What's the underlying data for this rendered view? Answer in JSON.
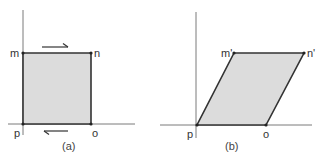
{
  "colors": {
    "fill": "#dcdcdc",
    "outline": "#333333",
    "axis": "#7a7a7a",
    "text": "#333333"
  },
  "panels": [
    {
      "caption": "(a)",
      "shape": "square",
      "points": {
        "m": {
          "label": "m",
          "x": 23,
          "y": 53
        },
        "n": {
          "label": "n",
          "x": 91,
          "y": 53
        },
        "o": {
          "label": "o",
          "x": 91,
          "y": 124
        },
        "p": {
          "label": "p",
          "x": 23,
          "y": 124
        }
      },
      "arrows": [
        {
          "position": "above-top-edge",
          "direction": "right"
        },
        {
          "position": "below-bottom-edge",
          "direction": "left"
        }
      ]
    },
    {
      "caption": "(b)",
      "shape": "parallelogram",
      "points": {
        "m": {
          "label": "m'",
          "x": 234,
          "y": 53
        },
        "n": {
          "label": "n'",
          "x": 304,
          "y": 53
        },
        "o": {
          "label": "o",
          "x": 266,
          "y": 125
        },
        "p": {
          "label": "p",
          "x": 197,
          "y": 125
        }
      },
      "arrows": []
    }
  ]
}
